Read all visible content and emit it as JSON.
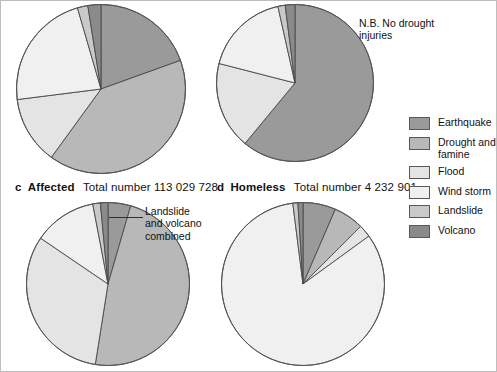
{
  "figure": {
    "background": "#ffffff",
    "border_color": "#bdbdbd"
  },
  "legend": {
    "title": "",
    "position": "right",
    "items": [
      {
        "label": "Earthquake",
        "color": "#9a9a9a"
      },
      {
        "label": "Drought and\nfamine",
        "color": "#b8b8b8"
      },
      {
        "label": "Flood",
        "color": "#e4e4e4"
      },
      {
        "label": "Wind storm",
        "color": "#f0f0f0"
      },
      {
        "label": "Landslide",
        "color": "#c9c9c9"
      },
      {
        "label": "Volcano",
        "color": "#8a8a8a"
      }
    ]
  },
  "annotations": {
    "no_drought": "N.B. No drought\ninjuries",
    "landslide_volcano": "Landslide\nand volcano\ncombined"
  },
  "captions": {
    "c": {
      "letter": "c",
      "kind": "Affected",
      "total": "Total number 113 029 728"
    },
    "d": {
      "letter": "d",
      "kind": "Homeless",
      "total": "Total number 4 232 901"
    }
  },
  "chart_data": {
    "type": "pie",
    "categories": [
      "Earthquake",
      "Drought and famine",
      "Flood",
      "Wind storm",
      "Landslide",
      "Volcano"
    ],
    "colors": [
      "#9a9a9a",
      "#b8b8b8",
      "#e4e4e4",
      "#f0f0f0",
      "#c9c9c9",
      "#8a8a8a"
    ],
    "start_angle_deg": 0,
    "direction": "clockwise",
    "charts": [
      {
        "id": "a",
        "letter": "",
        "kind": "",
        "total": "",
        "values": [
          19.5,
          40.5,
          13.0,
          22.5,
          2.0,
          2.5
        ],
        "note": ""
      },
      {
        "id": "b",
        "letter": "",
        "kind": "",
        "total": "",
        "values": [
          61.0,
          0.0,
          18.0,
          17.5,
          1.5,
          2.0
        ],
        "note": "N.B. No drought injuries"
      },
      {
        "id": "c",
        "letter": "c",
        "kind": "Affected",
        "total": "Total number 113 029 728",
        "values": [
          4.5,
          48.0,
          32.0,
          12.5,
          1.5,
          1.5
        ],
        "note": "Landslide and volcano combined"
      },
      {
        "id": "d",
        "letter": "d",
        "kind": "Homeless",
        "total": "Total number 4 232 901",
        "values": [
          6.5,
          6.0,
          2.5,
          83.0,
          1.0,
          1.0
        ],
        "note": ""
      }
    ]
  }
}
